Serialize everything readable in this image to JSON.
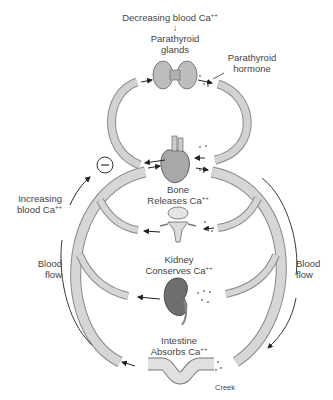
{
  "title_trigger": {
    "text": "Decreasing blood Ca",
    "sup": "++",
    "arrow": "↓"
  },
  "organs": {
    "parathyroid": {
      "line1": "Parathyroid",
      "line2": "glands"
    },
    "hormone": {
      "line1": "Parathyroid",
      "line2": "hormone"
    },
    "bone": {
      "line1": "Bone",
      "line2": "Releases Ca",
      "sup": "++"
    },
    "kidney": {
      "line1": "Kidney",
      "line2": "Conserves Ca",
      "sup": "++"
    },
    "intestine": {
      "line1": "Intestine",
      "line2": "Absorbs Ca",
      "sup": "++"
    }
  },
  "feedback": {
    "symbol": "−",
    "line1": "Increasing",
    "line2": "blood Ca",
    "sup": "++"
  },
  "flow_left": {
    "line1": "Blood",
    "line2": "flow"
  },
  "flow_right": {
    "line1": "Blood",
    "line2": "flow"
  },
  "credit": "Creek",
  "colors": {
    "vessel_fill": "#cfcfcf",
    "vessel_edge": "#8a8a8a",
    "text": "#444444",
    "organ": "#9a9a9a"
  }
}
